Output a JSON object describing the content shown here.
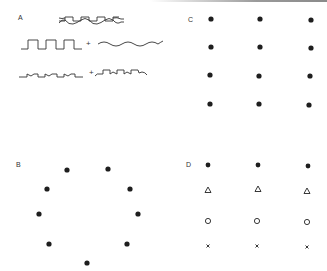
{
  "figure": {
    "panels": [
      {
        "id": "A",
        "label": "A",
        "description": "Waveform decomposition: composite wave = square wave + sine wave; distorted square wave + stepped wave",
        "rows": [
          {
            "name": "composite-wave",
            "elements": [
              "composite-waveform"
            ]
          },
          {
            "name": "square-plus-sine",
            "elements": [
              "square-wave",
              "+",
              "sine-wave"
            ]
          },
          {
            "name": "notched-plus-stepped",
            "elements": [
              "notched-square-wave",
              "+",
              "stepped-wave"
            ]
          }
        ],
        "plus_sign": "+"
      },
      {
        "id": "B",
        "label": "B",
        "description": "Nine dots arranged in a circle",
        "marker": "filled-dot",
        "points": [
          [
            67,
            170
          ],
          [
            108,
            169
          ],
          [
            47,
            189
          ],
          [
            130,
            189
          ],
          [
            39,
            214
          ],
          [
            138,
            214
          ],
          [
            49,
            244
          ],
          [
            127,
            244
          ],
          [
            87,
            263
          ]
        ]
      },
      {
        "id": "C",
        "label": "C",
        "description": "4 rows x 3 columns grid of identical filled dots",
        "marker": "filled-dot",
        "columns_x": [
          211,
          260,
          311
        ],
        "rows_y": [
          19,
          47,
          75,
          104
        ]
      },
      {
        "id": "D",
        "label": "D",
        "description": "4 rows x 3 columns grid; each row uses a different marker",
        "columns_x": [
          208,
          258,
          307
        ],
        "rows": [
          {
            "y": 165,
            "marker": "filled-dot",
            "glyph": "●"
          },
          {
            "y": 190,
            "marker": "open-triangle",
            "glyph": "△"
          },
          {
            "y": 221,
            "marker": "open-circle",
            "glyph": "○"
          },
          {
            "y": 246,
            "marker": "x-cross",
            "glyph": "×"
          }
        ]
      }
    ],
    "colors": {
      "ink": "#222222",
      "background": "#ffffff"
    }
  }
}
